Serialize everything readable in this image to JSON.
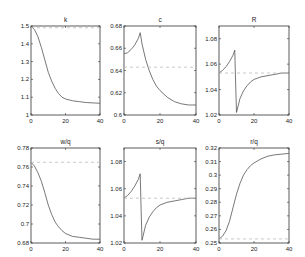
{
  "chart_data": [
    {
      "type": "line",
      "title": "k",
      "xlabel": "",
      "ylabel": "",
      "xlim": [
        0,
        40
      ],
      "ylim": [
        1.0,
        1.5
      ],
      "xticks": [
        0,
        20,
        40
      ],
      "yticks": [
        1,
        1.1,
        1.2,
        1.3,
        1.4,
        1.5
      ],
      "ytick_labels": [
        "1",
        "1.1",
        "1.2",
        "1.3",
        "1.4",
        "1.5"
      ],
      "grid": false,
      "series": [
        {
          "name": "path",
          "style": "solid",
          "x": [
            0,
            2,
            4,
            6,
            8,
            10,
            12,
            14,
            16,
            18,
            20,
            24,
            28,
            32,
            36,
            40
          ],
          "y": [
            1.5,
            1.48,
            1.44,
            1.38,
            1.31,
            1.24,
            1.19,
            1.15,
            1.12,
            1.1,
            1.09,
            1.08,
            1.075,
            1.07,
            1.068,
            1.066
          ]
        },
        {
          "name": "steady state",
          "style": "dashed",
          "x": [
            0,
            40
          ],
          "y": [
            1.49,
            1.49
          ]
        }
      ]
    },
    {
      "type": "line",
      "title": "c",
      "xlabel": "",
      "ylabel": "",
      "xlim": [
        0,
        40
      ],
      "ylim": [
        0.6,
        0.68
      ],
      "xticks": [
        0,
        20,
        40
      ],
      "yticks": [
        0.6,
        0.62,
        0.64,
        0.66,
        0.68
      ],
      "ytick_labels": [
        "0.6",
        "0.62",
        "0.64",
        "0.66",
        "0.68"
      ],
      "grid": false,
      "series": [
        {
          "name": "path",
          "style": "solid",
          "x": [
            0,
            2,
            4,
            6,
            8,
            9,
            10,
            12,
            14,
            16,
            18,
            20,
            24,
            28,
            32,
            36,
            40
          ],
          "y": [
            0.655,
            0.656,
            0.659,
            0.663,
            0.669,
            0.674,
            0.664,
            0.65,
            0.64,
            0.632,
            0.626,
            0.622,
            0.616,
            0.612,
            0.61,
            0.609,
            0.609
          ]
        },
        {
          "name": "steady state",
          "style": "dashed",
          "x": [
            0,
            40
          ],
          "y": [
            0.643,
            0.643
          ]
        }
      ]
    },
    {
      "type": "line",
      "title": "R",
      "xlabel": "",
      "ylabel": "",
      "xlim": [
        0,
        40
      ],
      "ylim": [
        1.02,
        1.09
      ],
      "xticks": [
        0,
        20,
        40
      ],
      "yticks": [
        1.02,
        1.04,
        1.06,
        1.08
      ],
      "ytick_labels": [
        "1.02",
        "1.04",
        "1.06",
        "1.08"
      ],
      "grid": false,
      "series": [
        {
          "name": "path",
          "style": "solid",
          "x": [
            0,
            2,
            4,
            6,
            8,
            9,
            9.5,
            10,
            12,
            14,
            16,
            18,
            20,
            24,
            28,
            32,
            36,
            40
          ],
          "y": [
            1.053,
            1.055,
            1.058,
            1.062,
            1.067,
            1.071,
            1.045,
            1.022,
            1.033,
            1.039,
            1.043,
            1.046,
            1.048,
            1.05,
            1.051,
            1.052,
            1.053,
            1.053
          ]
        },
        {
          "name": "steady state",
          "style": "dashed",
          "x": [
            0,
            40
          ],
          "y": [
            1.053,
            1.053
          ]
        }
      ]
    },
    {
      "type": "line",
      "title": "w/q",
      "xlabel": "",
      "ylabel": "",
      "xlim": [
        0,
        40
      ],
      "ylim": [
        0.68,
        0.78
      ],
      "xticks": [
        0,
        20,
        40
      ],
      "yticks": [
        0.68,
        0.7,
        0.72,
        0.74,
        0.76,
        0.78
      ],
      "ytick_labels": [
        "0.68",
        "0.7",
        "0.72",
        "0.74",
        "0.76",
        "0.78"
      ],
      "grid": false,
      "series": [
        {
          "name": "path",
          "style": "solid",
          "x": [
            0,
            2,
            4,
            6,
            8,
            10,
            12,
            14,
            16,
            18,
            20,
            24,
            28,
            32,
            36,
            40
          ],
          "y": [
            0.765,
            0.761,
            0.754,
            0.745,
            0.733,
            0.72,
            0.71,
            0.702,
            0.697,
            0.693,
            0.69,
            0.687,
            0.686,
            0.685,
            0.684,
            0.684
          ]
        },
        {
          "name": "steady state",
          "style": "dashed",
          "x": [
            0,
            40
          ],
          "y": [
            0.765,
            0.765
          ]
        }
      ]
    },
    {
      "type": "line",
      "title": "s/q",
      "xlabel": "",
      "ylabel": "",
      "xlim": [
        0,
        40
      ],
      "ylim": [
        1.02,
        1.09
      ],
      "xticks": [
        0,
        20,
        40
      ],
      "yticks": [
        1.02,
        1.04,
        1.06,
        1.08
      ],
      "ytick_labels": [
        "1.02",
        "1.04",
        "1.06",
        "1.08"
      ],
      "grid": false,
      "series": [
        {
          "name": "path",
          "style": "solid",
          "x": [
            0,
            2,
            4,
            6,
            8,
            9,
            9.5,
            10,
            12,
            14,
            16,
            18,
            20,
            24,
            28,
            32,
            36,
            40
          ],
          "y": [
            1.053,
            1.055,
            1.058,
            1.062,
            1.067,
            1.071,
            1.045,
            1.022,
            1.033,
            1.039,
            1.043,
            1.046,
            1.048,
            1.05,
            1.051,
            1.052,
            1.053,
            1.053
          ]
        },
        {
          "name": "steady state",
          "style": "dashed",
          "x": [
            0,
            40
          ],
          "y": [
            1.053,
            1.053
          ]
        }
      ]
    },
    {
      "type": "line",
      "title": "r/q",
      "xlabel": "",
      "ylabel": "",
      "xlim": [
        0,
        40
      ],
      "ylim": [
        0.25,
        0.32
      ],
      "xticks": [
        0,
        20,
        40
      ],
      "yticks": [
        0.25,
        0.26,
        0.27,
        0.28,
        0.29,
        0.3,
        0.31,
        0.32
      ],
      "ytick_labels": [
        "0.25",
        "0.26",
        "0.27",
        "0.28",
        "0.29",
        "0.3",
        "0.31",
        "0.32"
      ],
      "grid": false,
      "series": [
        {
          "name": "path",
          "style": "solid",
          "x": [
            0,
            2,
            4,
            6,
            8,
            10,
            12,
            14,
            16,
            18,
            20,
            24,
            28,
            32,
            36,
            40
          ],
          "y": [
            0.253,
            0.255,
            0.259,
            0.266,
            0.276,
            0.286,
            0.294,
            0.3,
            0.304,
            0.307,
            0.309,
            0.312,
            0.314,
            0.315,
            0.3155,
            0.316
          ]
        },
        {
          "name": "steady state",
          "style": "dashed",
          "x": [
            0,
            40
          ],
          "y": [
            0.253,
            0.253
          ]
        }
      ]
    }
  ],
  "layout": {
    "panels": [
      {
        "x0": 31,
        "x1": 100,
        "y0": 26,
        "y1": 115
      },
      {
        "x0": 124,
        "x1": 196,
        "y0": 26,
        "y1": 115
      },
      {
        "x0": 219,
        "x1": 289,
        "y0": 26,
        "y1": 115
      },
      {
        "x0": 31,
        "x1": 100,
        "y0": 148,
        "y1": 243
      },
      {
        "x0": 124,
        "x1": 196,
        "y0": 148,
        "y1": 243
      },
      {
        "x0": 219,
        "x1": 289,
        "y0": 148,
        "y1": 243
      }
    ]
  },
  "colors": {
    "series": "#555555",
    "reference": "#bbbbbb",
    "axis": "#333333"
  }
}
